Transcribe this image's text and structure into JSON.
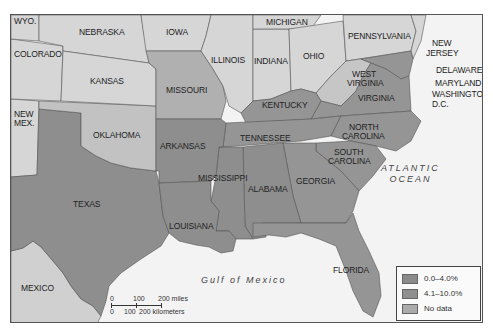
{
  "map": {
    "colors": {
      "outside": "#d6d6d6",
      "low_0_4": "#8e8e8e",
      "mid_4_10": "#959595",
      "no_data": "#b8b8b8",
      "water": "#f3f3f3",
      "mexico": "#d0d0d0"
    },
    "states": [
      {
        "name": "WYO.",
        "category": "outside"
      },
      {
        "name": "NEBRASKA",
        "category": "outside"
      },
      {
        "name": "IOWA",
        "category": "outside"
      },
      {
        "name": "MICHIGAN",
        "category": "outside"
      },
      {
        "name": "PENNSYLVANIA",
        "category": "outside"
      },
      {
        "name": "NEW JERSEY",
        "category": "outside"
      },
      {
        "name": "COLORADO",
        "category": "outside"
      },
      {
        "name": "KANSAS",
        "category": "outside"
      },
      {
        "name": "ILLINOIS",
        "category": "outside"
      },
      {
        "name": "INDIANA",
        "category": "outside"
      },
      {
        "name": "OHIO",
        "category": "outside"
      },
      {
        "name": "NEW MEX.",
        "category": "outside"
      },
      {
        "name": "MISSOURI",
        "category": "no_data"
      },
      {
        "name": "WEST VIRGINIA",
        "category": "no_data"
      },
      {
        "name": "OKLAHOMA",
        "category": "no_data"
      },
      {
        "name": "DELAWARE",
        "category": "mid_4_10"
      },
      {
        "name": "MARYLAND",
        "category": "mid_4_10"
      },
      {
        "name": "WASHINGTON, D.C.",
        "category": "mid_4_10"
      },
      {
        "name": "KENTUCKY",
        "category": "mid_4_10"
      },
      {
        "name": "VIRGINIA",
        "category": "mid_4_10"
      },
      {
        "name": "TENNESSEE",
        "category": "mid_4_10"
      },
      {
        "name": "NORTH CAROLINA",
        "category": "mid_4_10"
      },
      {
        "name": "ARKANSAS",
        "category": "low_0_4"
      },
      {
        "name": "SOUTH CAROLINA",
        "category": "mid_4_10"
      },
      {
        "name": "MISSISSIPPI",
        "category": "low_0_4"
      },
      {
        "name": "ALABAMA",
        "category": "low_0_4"
      },
      {
        "name": "GEORGIA",
        "category": "mid_4_10"
      },
      {
        "name": "TEXAS",
        "category": "low_0_4"
      },
      {
        "name": "LOUISIANA",
        "category": "low_0_4"
      },
      {
        "name": "FLORIDA",
        "category": "mid_4_10"
      }
    ],
    "labels": {
      "wyo": "WYO.",
      "nebraska": "NEBRASKA",
      "iowa": "IOWA",
      "michigan": "MICHIGAN",
      "pennsylvania": "PENNSYLVANIA",
      "new_jersey_1": "NEW",
      "new_jersey_2": "JERSEY",
      "colorado": "COLORADO",
      "illinois": "ILLINOIS",
      "indiana": "INDIANA",
      "ohio": "OHIO",
      "kansas": "KANSAS",
      "missouri": "MISSOURI",
      "west_virginia_1": "WEST",
      "west_virginia_2": "VIRGINIA",
      "delaware": "DELAWARE",
      "maryland": "MARYLAND",
      "washington_dc_1": "WASHINGTON,",
      "washington_dc_2": "D.C.",
      "new_mex_1": "NEW",
      "new_mex_2": "MEX.",
      "kentucky": "KENTUCKY",
      "virginia": "VIRGINIA",
      "oklahoma": "OKLAHOMA",
      "arkansas": "ARKANSAS",
      "tennessee": "TENNESSEE",
      "north_carolina_1": "NORTH",
      "north_carolina_2": "CAROLINA",
      "south_carolina_1": "SOUTH",
      "south_carolina_2": "CAROLINA",
      "mississippi": "MISSISSIPPI",
      "alabama": "ALABAMA",
      "georgia": "GEORGIA",
      "texas": "TEXAS",
      "louisiana": "LOUISIANA",
      "florida": "FLORIDA",
      "mexico": "MEXICO",
      "atlantic_1": "ATLANTIC",
      "atlantic_2": "OCEAN",
      "gulf": "Gulf of Mexico"
    },
    "legend": {
      "items": [
        {
          "label": "0.0–4.0%",
          "color": "#8a8a8a"
        },
        {
          "label": "4.1–10.0%",
          "color": "#8f8f8f"
        },
        {
          "label": "No data",
          "color": "#ababab"
        }
      ]
    },
    "scale": {
      "miles_ticks": [
        "0",
        "100",
        "200 miles"
      ],
      "km_ticks": [
        "0",
        "100",
        "200 kilometers"
      ]
    }
  }
}
